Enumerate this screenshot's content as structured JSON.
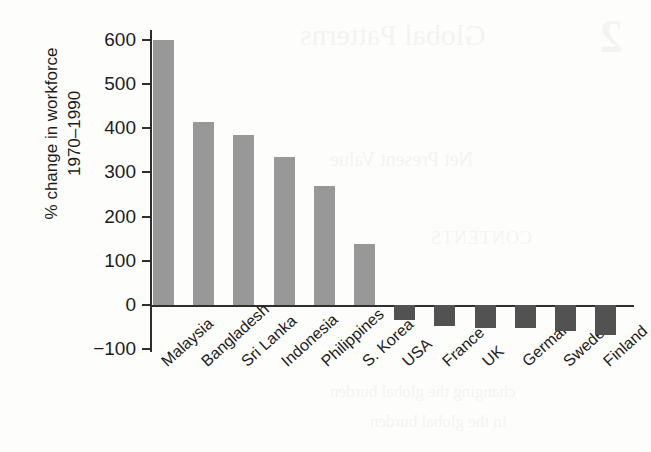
{
  "page": {
    "background_color": "#fdfdfc",
    "bleed_through_text": {
      "title": "Global Patterns",
      "chapter_number": "2",
      "subtitle": "Net Present Value",
      "contents_heading": "CONTENTS",
      "body_line_1": "changing the global burden",
      "body_line_2": "in the global burden"
    }
  },
  "chart_data": {
    "type": "bar",
    "title": "",
    "xlabel": "",
    "ylabel": "% change in workforce 1970–1990",
    "ylabel_line1": "% change in workforce",
    "ylabel_line2": "1970–1990",
    "categories": [
      "Malaysia",
      "Bangladesh",
      "Sri Lanka",
      "Indonesia",
      "Philippines",
      "S. Korea",
      "USA",
      "France",
      "UK",
      "Germany",
      "Sweden",
      "Finland"
    ],
    "values": [
      600,
      415,
      385,
      335,
      270,
      138,
      -34,
      -47,
      -52,
      -53,
      -58,
      -68
    ],
    "ylim": [
      -100,
      620
    ],
    "ytick_values": [
      600,
      500,
      400,
      300,
      200,
      100,
      0,
      -100
    ],
    "ytick_labels": [
      "600",
      "500",
      "400",
      "300",
      "200",
      "100",
      "0",
      "−100"
    ],
    "grid": false,
    "legend": "none",
    "bar_colors": {
      "positive": "#989898",
      "negative": "#525252"
    },
    "axis_color": "#2e2e2e"
  }
}
